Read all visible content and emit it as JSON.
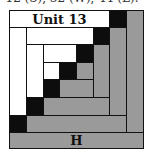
{
  "caption": "12 (S), 32 (W), 44 (L).",
  "diagram": {
    "title_label": "Unit 13",
    "bottom_label": "H",
    "colors": {
      "white": "#ffffff",
      "black": "#0d0d0d",
      "gray": "#9a9a9a",
      "line": "#111111"
    },
    "grid": {
      "columns_px": [
        0,
        17,
        34,
        50,
        67,
        84,
        100,
        117,
        134
      ],
      "rows_px": [
        0,
        17,
        34,
        52,
        69,
        87,
        105,
        122,
        138
      ]
    },
    "pieces": [
      {
        "id": "unit13-strip",
        "fill": "white",
        "c": [
          0,
          6
        ],
        "r": [
          0,
          1
        ],
        "label": "Unit 13"
      },
      {
        "id": "corner-1",
        "fill": "black",
        "c": [
          6,
          7
        ],
        "r": [
          0,
          1
        ]
      },
      {
        "id": "right-outer",
        "fill": "gray",
        "c": [
          7,
          8
        ],
        "r": [
          0,
          7
        ]
      },
      {
        "id": "left-outer",
        "fill": "white",
        "c": [
          0,
          1
        ],
        "r": [
          1,
          6
        ]
      },
      {
        "id": "corner-2",
        "fill": "black",
        "c": [
          0,
          1
        ],
        "r": [
          6,
          7
        ]
      },
      {
        "id": "bottom-outer",
        "fill": "gray",
        "c": [
          1,
          7
        ],
        "r": [
          6,
          7
        ]
      },
      {
        "id": "h-strip",
        "fill": "gray",
        "c": [
          0,
          8
        ],
        "r": [
          7,
          8
        ],
        "label": "H"
      },
      {
        "id": "top-2",
        "fill": "white",
        "c": [
          1,
          5
        ],
        "r": [
          1,
          2
        ]
      },
      {
        "id": "corner-3",
        "fill": "black",
        "c": [
          5,
          6
        ],
        "r": [
          1,
          2
        ]
      },
      {
        "id": "right-2",
        "fill": "gray",
        "c": [
          6,
          7
        ],
        "r": [
          1,
          6
        ]
      },
      {
        "id": "left-2",
        "fill": "white",
        "c": [
          1,
          2
        ],
        "r": [
          2,
          5
        ]
      },
      {
        "id": "corner-4",
        "fill": "black",
        "c": [
          1,
          2
        ],
        "r": [
          5,
          6
        ]
      },
      {
        "id": "bottom-2",
        "fill": "gray",
        "c": [
          2,
          6
        ],
        "r": [
          5,
          6
        ]
      },
      {
        "id": "top-3",
        "fill": "white",
        "c": [
          2,
          4
        ],
        "r": [
          2,
          3
        ]
      },
      {
        "id": "corner-5",
        "fill": "black",
        "c": [
          4,
          5
        ],
        "r": [
          2,
          3
        ]
      },
      {
        "id": "right-3",
        "fill": "gray",
        "c": [
          5,
          6
        ],
        "r": [
          2,
          5
        ]
      },
      {
        "id": "center-white",
        "fill": "white",
        "c": [
          2,
          3
        ],
        "r": [
          3,
          4
        ]
      },
      {
        "id": "center-black",
        "fill": "black",
        "c": [
          3,
          4
        ],
        "r": [
          3,
          4
        ]
      },
      {
        "id": "center-gray",
        "fill": "gray",
        "c": [
          4,
          5
        ],
        "r": [
          3,
          4
        ]
      },
      {
        "id": "corner-6",
        "fill": "black",
        "c": [
          2,
          3
        ],
        "r": [
          4,
          5
        ]
      },
      {
        "id": "bottom-3",
        "fill": "gray",
        "c": [
          3,
          5
        ],
        "r": [
          4,
          5
        ]
      }
    ]
  }
}
